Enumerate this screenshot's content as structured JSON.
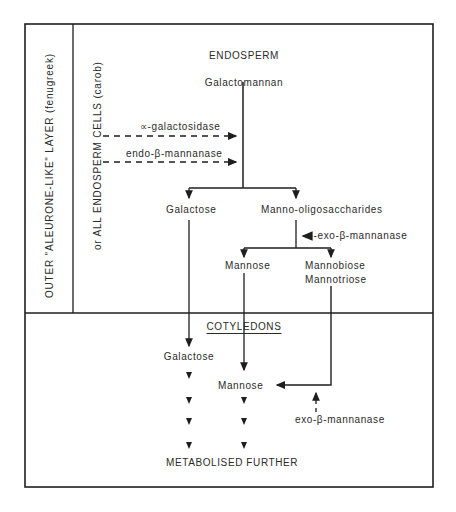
{
  "diagram": {
    "title": "ENDOSPERM",
    "side_labels": {
      "outer_layer": "OUTER \"ALEURONE-LIKE\" LAYER  (fenugreek)",
      "all_cells": "or ALL ENDOSPERM CELLS (carob)"
    },
    "endosperm": {
      "substrate": "Galactomannan",
      "enzyme_1": "∝-galactosidase",
      "enzyme_2": "endo-β-mannanase",
      "product_left": "Galactose",
      "product_right": "Manno-oligosaccharides",
      "enzyme_3": "←-exo-β-mannanase",
      "sub_left": "Mannose",
      "sub_right_1": "Mannobiose",
      "sub_right_2": "Mannotriose"
    },
    "cotyledons": {
      "title": "COTYLEDONS",
      "galactose": "Galactose",
      "mannose": "Mannose",
      "enzyme": "exo-β-mannanase",
      "final": "METABOLISED FURTHER"
    },
    "colors": {
      "line": "#1e1e1e",
      "text": "#2b2b2b",
      "background": "#ffffff"
    }
  }
}
